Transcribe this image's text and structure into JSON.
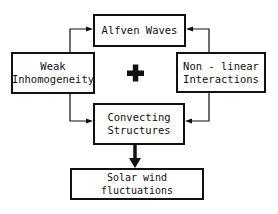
{
  "diagram": {
    "nodes": {
      "alfven": {
        "label": "Alfven Waves"
      },
      "weak": {
        "line1": "Weak",
        "line2": "Inhomogeneity"
      },
      "nonlinear": {
        "line1": "Non - linear",
        "line2": "Interactions"
      },
      "convecting": {
        "line1": "Convecting",
        "line2": "Structures"
      },
      "solar": {
        "label": "Solar wind fluctuations"
      }
    },
    "operator": "+",
    "edges": [
      {
        "from": "Weak Inhomogeneity",
        "to": "Alfven Waves"
      },
      {
        "from": "Weak Inhomogeneity",
        "to": "Convecting Structures"
      },
      {
        "from": "Non - linear Interactions",
        "to": "Alfven Waves"
      },
      {
        "from": "Non - linear Interactions",
        "to": "Convecting Structures"
      },
      {
        "from": "Convecting Structures",
        "to": "Solar wind fluctuations",
        "style": "thick"
      }
    ],
    "colors": {
      "stroke": "#111111",
      "background": "#ffffff"
    }
  }
}
